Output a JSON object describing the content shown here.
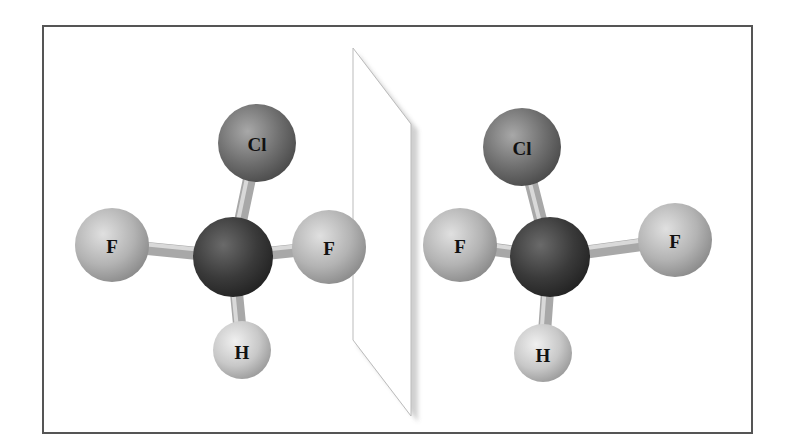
{
  "figure": {
    "colors": {
      "frame": "#555555",
      "carbon": "#3a3a3a",
      "chlorine": "#6e6e6e",
      "fluorine": "#b3b3b3",
      "hydrogen": "#c8c8c8",
      "bond": "#b0b0b0",
      "mirror": "#ffffff"
    },
    "left_molecule": {
      "atoms": [
        {
          "id": "C",
          "label": "",
          "x": 233,
          "y": 257,
          "r": 40
        },
        {
          "id": "Cl",
          "label": "Cl",
          "x": 257,
          "y": 143,
          "r": 39
        },
        {
          "id": "F1",
          "label": "F",
          "x": 112,
          "y": 245,
          "r": 37
        },
        {
          "id": "F2",
          "label": "F",
          "x": 329,
          "y": 247,
          "r": 37
        },
        {
          "id": "H",
          "label": "H",
          "x": 242,
          "y": 350,
          "r": 29
        }
      ]
    },
    "right_molecule": {
      "atoms": [
        {
          "id": "C",
          "label": "",
          "x": 550,
          "y": 257,
          "r": 40
        },
        {
          "id": "Cl",
          "label": "Cl",
          "x": 522,
          "y": 147,
          "r": 39
        },
        {
          "id": "F1",
          "label": "F",
          "x": 460,
          "y": 245,
          "r": 37
        },
        {
          "id": "F2",
          "label": "F",
          "x": 675,
          "y": 240,
          "r": 37
        },
        {
          "id": "H",
          "label": "H",
          "x": 543,
          "y": 353,
          "r": 29
        }
      ]
    },
    "labels": {
      "left_cl": "Cl",
      "left_f1": "F",
      "left_f2": "F",
      "left_h": "H",
      "right_cl": "Cl",
      "right_f1": "F",
      "right_f2": "F",
      "right_h": "H"
    }
  }
}
